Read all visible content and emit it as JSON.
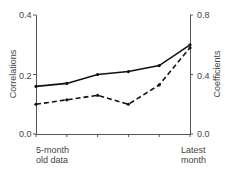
{
  "chart_data": {
    "type": "line",
    "title": "",
    "categories": [
      "5-month old data",
      "",
      "",
      "",
      "",
      "Latest month"
    ],
    "x_tick_labels": {
      "first": [
        "5-month",
        "old data"
      ],
      "last": [
        "Latest",
        "month"
      ]
    },
    "series": [
      {
        "name": "Correlations",
        "axis": "left",
        "style": "solid",
        "values": [
          0.16,
          0.17,
          0.2,
          0.21,
          0.23,
          0.3
        ]
      },
      {
        "name": "Coefficients",
        "axis": "right",
        "style": "dashed",
        "values": [
          0.2,
          0.23,
          0.26,
          0.2,
          0.33,
          0.58
        ]
      }
    ],
    "left_axis": {
      "label": "Correlations",
      "ylim": [
        0.0,
        0.4
      ],
      "ticks": [
        "0.0",
        "0.2",
        "0.4"
      ]
    },
    "right_axis": {
      "label": "Coefficients",
      "ylim": [
        0.0,
        0.8
      ],
      "ticks": [
        "0.0",
        "0.4",
        "0.8"
      ]
    },
    "grid": false,
    "legend": "none"
  }
}
